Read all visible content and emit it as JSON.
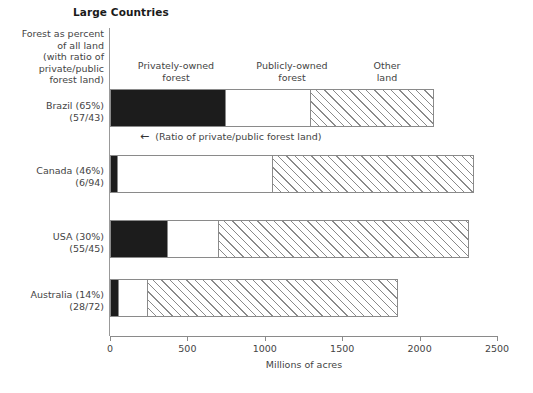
{
  "chart_data": {
    "type": "bar",
    "orientation": "horizontal",
    "stacked": true,
    "title": "Large Countries",
    "xlabel": "Millions of acres",
    "ylabel": "",
    "xlim": [
      0,
      2500
    ],
    "xticks": [
      0,
      500,
      1000,
      1500,
      2000,
      2500
    ],
    "grid": false,
    "legend_position": "top-inline-column-headers",
    "categories": [
      "Brazil (65%)",
      "Canada (46%)",
      "USA (30%)",
      "Australia (14%)"
    ],
    "category_sublabels": [
      "(57/43)",
      "(6/94)",
      "(55/45)",
      "(28/72)"
    ],
    "series": [
      {
        "name": "Privately-owned forest",
        "values": [
          750,
          45,
          370,
          50
        ]
      },
      {
        "name": "Publicly-owned forest",
        "values": [
          550,
          1005,
          330,
          190
        ]
      },
      {
        "name": "Other land",
        "values": [
          790,
          1300,
          1620,
          1620
        ]
      }
    ],
    "totals": [
      2090,
      2350,
      2320,
      1860
    ],
    "annotations": [
      {
        "text": "(Ratio of private/public forest land)",
        "arrow": "left"
      }
    ]
  },
  "header": {
    "title": "Large Countries"
  },
  "left_caption": {
    "lines": [
      "Forest as percent",
      "of all land",
      "(with ratio of",
      "private/public",
      "forest land)"
    ]
  },
  "column_headers": [
    {
      "line1": "Privately-owned",
      "line2": "forest"
    },
    {
      "line1": "Publicly-owned",
      "line2": "forest"
    },
    {
      "line1": "Other",
      "line2": "land"
    }
  ],
  "rows": [
    {
      "label": "Brazil (65%)",
      "sublabel": "(57/43)",
      "private": 750,
      "public": 550,
      "other": 790
    },
    {
      "label": "Canada (46%)",
      "sublabel": "(6/94)",
      "private": 45,
      "public": 1005,
      "other": 1300
    },
    {
      "label": "USA (30%)",
      "sublabel": "(55/45)",
      "private": 370,
      "public": 330,
      "other": 1620
    },
    {
      "label": "Australia (14%)",
      "sublabel": "(28/72)",
      "private": 50,
      "public": 190,
      "other": 1620
    }
  ],
  "axis": {
    "ticks": [
      "0",
      "500",
      "1000",
      "1500",
      "2000",
      "2500"
    ],
    "title": "Millions of acres"
  },
  "annotation": {
    "arrow_glyph": "←",
    "text": "(Ratio of private/public forest land)"
  },
  "colors": {
    "private": "#1c1c1c",
    "public": "#ffffff",
    "other_hatch": "#8a8a8a",
    "outline": "#8a8a8a",
    "text": "#444444"
  }
}
